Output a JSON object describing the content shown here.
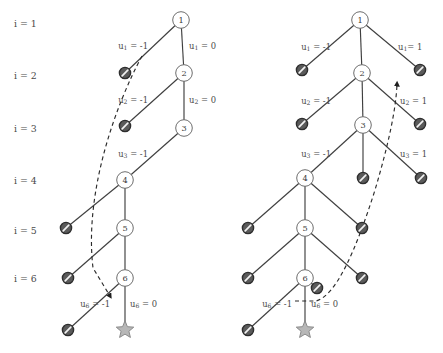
{
  "figure": {
    "title": "",
    "background_color": "#ffffff",
    "node_fill": "#ffffff",
    "node_stroke": "#6e6e6e",
    "blocked_fill": "#5a5a5a",
    "star_fill": "#b7b7b7",
    "edge_color": "#3f3f3f",
    "dashed_color": "#2b2b2b"
  },
  "row_labels": [
    {
      "text": "i = 1",
      "i": "i",
      "eq": "=",
      "value": "1",
      "x": 14,
      "y": 23
    },
    {
      "text": "i = 2",
      "i": "i",
      "eq": "=",
      "value": "2",
      "x": 14,
      "y": 75
    },
    {
      "text": "i = 3",
      "i": "i",
      "eq": "=",
      "value": "3",
      "x": 14,
      "y": 128
    },
    {
      "text": "i = 4",
      "i": "i",
      "eq": "=",
      "value": "4",
      "x": 14,
      "y": 180
    },
    {
      "text": "i = 5",
      "i": "i",
      "eq": "=",
      "value": "5",
      "x": 14,
      "y": 230
    },
    {
      "text": "i = 6",
      "i": "i",
      "eq": "=",
      "value": "6",
      "x": 14,
      "y": 278
    }
  ],
  "left_tree": {
    "name": "left-tree",
    "nodes": [
      {
        "id": "1",
        "label": "1",
        "x": 181,
        "y": 20
      },
      {
        "id": "2",
        "label": "2",
        "x": 184,
        "y": 73
      },
      {
        "id": "3",
        "label": "3",
        "x": 184,
        "y": 128
      },
      {
        "id": "4",
        "label": "4",
        "x": 125,
        "y": 180
      },
      {
        "id": "5",
        "label": "5",
        "x": 125,
        "y": 228
      },
      {
        "id": "6",
        "label": "6",
        "x": 125,
        "y": 278
      }
    ],
    "blocked": [
      {
        "x": 125,
        "y": 73
      },
      {
        "x": 125,
        "y": 126
      },
      {
        "x": 66,
        "y": 228
      },
      {
        "x": 68,
        "y": 278
      },
      {
        "x": 68,
        "y": 330
      }
    ],
    "star": {
      "x": 125,
      "y": 330
    },
    "edges": [
      {
        "from": [
          181,
          20
        ],
        "to": [
          125,
          73
        ]
      },
      {
        "from": [
          181,
          20
        ],
        "to": [
          184,
          73
        ]
      },
      {
        "from": [
          184,
          73
        ],
        "to": [
          125,
          126
        ]
      },
      {
        "from": [
          184,
          73
        ],
        "to": [
          184,
          128
        ]
      },
      {
        "from": [
          184,
          128
        ],
        "to": [
          125,
          180
        ]
      },
      {
        "from": [
          125,
          180
        ],
        "to": [
          66,
          228
        ]
      },
      {
        "from": [
          125,
          180
        ],
        "to": [
          125,
          228
        ]
      },
      {
        "from": [
          125,
          228
        ],
        "to": [
          68,
          278
        ]
      },
      {
        "from": [
          125,
          228
        ],
        "to": [
          125,
          278
        ]
      },
      {
        "from": [
          125,
          278
        ],
        "to": [
          68,
          330
        ]
      },
      {
        "from": [
          125,
          278
        ],
        "to": [
          125,
          330
        ]
      }
    ],
    "dashed_path": "M 142,56 C 116,104 84,192 93,268 L 110,296",
    "arrow_tip": [
      113,
      300
    ],
    "labels": [
      {
        "text": "u1 = -1",
        "base": "u",
        "sub": "1",
        "rest": " = -1",
        "x": 148,
        "y": 46,
        "align": "end"
      },
      {
        "text": "u1 = 0",
        "base": "u",
        "sub": "1",
        "rest": " = 0",
        "x": 189,
        "y": 46,
        "align": "start"
      },
      {
        "text": "u2 = -1",
        "base": "u",
        "sub": "2",
        "rest": " = -1",
        "x": 148,
        "y": 100,
        "align": "end"
      },
      {
        "text": "u2 = 0",
        "base": "u",
        "sub": "2",
        "rest": " = 0",
        "x": 189,
        "y": 100,
        "align": "start"
      },
      {
        "text": "u3 = -1",
        "base": "u",
        "sub": "3",
        "rest": " = -1",
        "x": 148,
        "y": 154,
        "align": "end"
      },
      {
        "text": "u6 = -1",
        "base": "u",
        "sub": "6",
        "rest": " = -1",
        "x": 110,
        "y": 304,
        "align": "end"
      },
      {
        "text": "u6 = 0",
        "base": "u",
        "sub": "6",
        "rest": " = 0",
        "x": 130,
        "y": 304,
        "align": "start"
      }
    ]
  },
  "right_tree": {
    "name": "right-tree",
    "nodes": [
      {
        "id": "1",
        "label": "1",
        "x": 360,
        "y": 20
      },
      {
        "id": "2",
        "label": "2",
        "x": 362,
        "y": 73
      },
      {
        "id": "3",
        "label": "3",
        "x": 363,
        "y": 125
      },
      {
        "id": "4",
        "label": "4",
        "x": 305,
        "y": 178
      },
      {
        "id": "5",
        "label": "5",
        "x": 305,
        "y": 228
      },
      {
        "id": "6",
        "label": "6",
        "x": 305,
        "y": 278
      }
    ],
    "blocked": [
      {
        "x": 302,
        "y": 70
      },
      {
        "x": 420,
        "y": 70
      },
      {
        "x": 302,
        "y": 124
      },
      {
        "x": 420,
        "y": 124
      },
      {
        "x": 363,
        "y": 178
      },
      {
        "x": 421,
        "y": 178
      },
      {
        "x": 248,
        "y": 228
      },
      {
        "x": 362,
        "y": 228
      },
      {
        "x": 248,
        "y": 278
      },
      {
        "x": 362,
        "y": 278
      },
      {
        "x": 317,
        "y": 288
      },
      {
        "x": 248,
        "y": 330
      }
    ],
    "star": {
      "x": 305,
      "y": 330
    },
    "edges": [
      {
        "from": [
          360,
          20
        ],
        "to": [
          302,
          70
        ]
      },
      {
        "from": [
          360,
          20
        ],
        "to": [
          362,
          73
        ]
      },
      {
        "from": [
          360,
          20
        ],
        "to": [
          420,
          70
        ]
      },
      {
        "from": [
          362,
          73
        ],
        "to": [
          302,
          124
        ]
      },
      {
        "from": [
          362,
          73
        ],
        "to": [
          363,
          125
        ]
      },
      {
        "from": [
          362,
          73
        ],
        "to": [
          420,
          124
        ]
      },
      {
        "from": [
          363,
          125
        ],
        "to": [
          305,
          178
        ]
      },
      {
        "from": [
          363,
          125
        ],
        "to": [
          363,
          178
        ]
      },
      {
        "from": [
          363,
          125
        ],
        "to": [
          421,
          178
        ]
      },
      {
        "from": [
          305,
          178
        ],
        "to": [
          248,
          228
        ]
      },
      {
        "from": [
          305,
          178
        ],
        "to": [
          305,
          228
        ]
      },
      {
        "from": [
          305,
          178
        ],
        "to": [
          362,
          228
        ]
      },
      {
        "from": [
          305,
          228
        ],
        "to": [
          248,
          278
        ]
      },
      {
        "from": [
          305,
          228
        ],
        "to": [
          305,
          278
        ]
      },
      {
        "from": [
          305,
          228
        ],
        "to": [
          362,
          278
        ]
      },
      {
        "from": [
          305,
          278
        ],
        "to": [
          248,
          330
        ]
      },
      {
        "from": [
          305,
          278
        ],
        "to": [
          305,
          330
        ]
      },
      {
        "from": [
          305,
          278
        ],
        "to": [
          317,
          288
        ]
      }
    ],
    "dashed_path": "M 295,301 L 316,301 C 336,296 356,250 375,190 C 388,146 396,110 397,84",
    "arrow_tip": [
      397,
      48
    ],
    "labels": [
      {
        "text": "u1 = -1",
        "base": "u",
        "sub": "1",
        "rest": " = -1",
        "x": 331,
        "y": 47,
        "align": "end"
      },
      {
        "text": "u1= 1",
        "base": "u",
        "sub": "1",
        "rest": "= 1",
        "x": 398,
        "y": 47,
        "align": "start"
      },
      {
        "text": "u2 = -1",
        "base": "u",
        "sub": "2",
        "rest": " = -1",
        "x": 331,
        "y": 101,
        "align": "end"
      },
      {
        "text": "u2 = 1",
        "base": "u",
        "sub": "2",
        "rest": " = 1",
        "x": 400,
        "y": 101,
        "align": "start"
      },
      {
        "text": "u3 = -1",
        "base": "u",
        "sub": "3",
        "rest": " = -1",
        "x": 331,
        "y": 154,
        "align": "end"
      },
      {
        "text": "u3 = 1",
        "base": "u",
        "sub": "3",
        "rest": " = 1",
        "x": 400,
        "y": 154,
        "align": "start"
      },
      {
        "text": "u6 = -1",
        "base": "u",
        "sub": "6",
        "rest": " = -1",
        "x": 292,
        "y": 304,
        "align": "end"
      },
      {
        "text": "u6 = 0",
        "base": "u",
        "sub": "6",
        "rest": " = 0",
        "x": 311,
        "y": 304,
        "align": "start"
      }
    ]
  }
}
